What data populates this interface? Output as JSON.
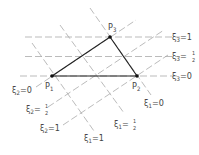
{
  "diagram": {
    "title": "",
    "points": [
      {
        "id": "P1",
        "label": "P",
        "sub": "1",
        "x": 52,
        "y": 76
      },
      {
        "id": "P2",
        "label": "P",
        "sub": "2",
        "x": 137,
        "y": 76
      },
      {
        "id": "P3",
        "label": "P",
        "sub": "3",
        "x": 110,
        "y": 37
      }
    ],
    "coordinate_labels": {
      "xi3_1": {
        "var": "ξ",
        "sub": "3",
        "eq": "=1"
      },
      "xi3_half": {
        "var": "ξ",
        "sub": "3",
        "eq": "=",
        "num": "1",
        "den": "2"
      },
      "xi3_0": {
        "var": "ξ",
        "sub": "3",
        "eq": "=0"
      },
      "xi2_0": {
        "var": "ξ",
        "sub": "2",
        "eq": "=0"
      },
      "xi2_half": {
        "var": "ξ",
        "sub": "2",
        "eq": "=",
        "num": "1",
        "den": "2"
      },
      "xi2_1": {
        "var": "ξ",
        "sub": "2",
        "eq": "=1"
      },
      "xi1_0": {
        "var": "ξ",
        "sub": "1",
        "eq": "=0"
      },
      "xi1_half": {
        "var": "ξ",
        "sub": "1",
        "eq": "=",
        "num": "1",
        "den": "2"
      },
      "xi1_1": {
        "var": "ξ",
        "sub": "1",
        "eq": "=1"
      }
    },
    "colors": {
      "triangle": "#222222",
      "dashed": "#aaaaaa",
      "label": "#444444"
    }
  }
}
